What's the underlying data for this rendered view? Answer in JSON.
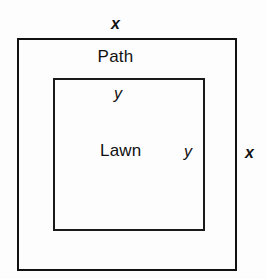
{
  "diagram": {
    "type": "geometry-figure",
    "background_color": "#fdfdfd",
    "stroke_color": "#111111",
    "shapes": {
      "outer": {
        "name": "outer-rectangle",
        "region_label": "Path",
        "side_label": "x"
      },
      "inner": {
        "name": "inner-rectangle",
        "region_label": "Lawn",
        "side_label": "y"
      }
    },
    "labels": {
      "x_top": "x",
      "x_right": "x",
      "y_top": "y",
      "y_right": "y",
      "path": "Path",
      "lawn": "Lawn"
    }
  }
}
